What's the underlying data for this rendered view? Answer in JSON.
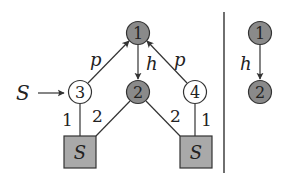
{
  "colors": {
    "filled_node": "#8a8a8a",
    "empty_node": "#ffffff",
    "factor_box": "#a9a9a9",
    "stroke": "#333333"
  },
  "left_graph": {
    "start_label": "S",
    "start_arrow": "→",
    "nodes": [
      {
        "id": "1",
        "label": "1",
        "filled": true
      },
      {
        "id": "2",
        "label": "2",
        "filled": true
      },
      {
        "id": "3",
        "label": "3",
        "filled": false
      },
      {
        "id": "4",
        "label": "4",
        "filled": false
      }
    ],
    "factors": [
      {
        "id": "S_left",
        "label": "S"
      },
      {
        "id": "S_right",
        "label": "S"
      }
    ],
    "edges": [
      {
        "from": "3",
        "to": "1",
        "label": "p",
        "directed": true
      },
      {
        "from": "1",
        "to": "2",
        "label": "h",
        "directed": true
      },
      {
        "from": "4",
        "to": "1",
        "label": "p",
        "directed": true
      },
      {
        "from": "3",
        "to": "S_left",
        "label": "1",
        "directed": false
      },
      {
        "from": "2",
        "to": "S_left",
        "label": "2",
        "directed": false
      },
      {
        "from": "2",
        "to": "S_right",
        "label": "2",
        "directed": false
      },
      {
        "from": "4",
        "to": "S_right",
        "label": "1",
        "directed": false
      }
    ]
  },
  "right_graph": {
    "nodes": [
      {
        "id": "1",
        "label": "1",
        "filled": true
      },
      {
        "id": "2",
        "label": "2",
        "filled": true
      }
    ],
    "edges": [
      {
        "from": "1",
        "to": "2",
        "label": "h",
        "directed": true
      }
    ]
  }
}
